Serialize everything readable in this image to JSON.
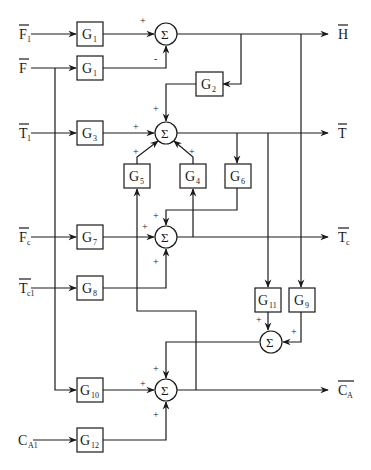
{
  "diagram": {
    "type": "block-diagram",
    "inputs": [
      {
        "id": "F1",
        "main": "F",
        "sub": "1",
        "overbar": true
      },
      {
        "id": "F",
        "main": "F",
        "sub": "",
        "overbar": true
      },
      {
        "id": "T1",
        "main": "T",
        "sub": "1",
        "overbar": true
      },
      {
        "id": "Fc",
        "main": "F",
        "sub": "c",
        "overbar": true
      },
      {
        "id": "Tc1",
        "main": "T",
        "sub": "c1",
        "overbar": true
      },
      {
        "id": "CA1",
        "main": "C",
        "sub": "A1",
        "overbar": false
      }
    ],
    "outputs": [
      {
        "id": "H",
        "main": "H",
        "sub": "",
        "overbar": true
      },
      {
        "id": "T",
        "main": "T",
        "sub": "",
        "overbar": true
      },
      {
        "id": "Tc",
        "main": "T",
        "sub": "c",
        "overbar": true
      },
      {
        "id": "CA",
        "main": "C",
        "sub": "A",
        "overbar": true
      }
    ],
    "blocks": [
      {
        "id": "G1a",
        "main": "G",
        "sub": "1"
      },
      {
        "id": "G1b",
        "main": "G",
        "sub": "1"
      },
      {
        "id": "G2",
        "main": "G",
        "sub": "2"
      },
      {
        "id": "G3",
        "main": "G",
        "sub": "3"
      },
      {
        "id": "G5",
        "main": "G",
        "sub": "5"
      },
      {
        "id": "G4",
        "main": "G",
        "sub": "4"
      },
      {
        "id": "G6",
        "main": "G",
        "sub": "6"
      },
      {
        "id": "G7",
        "main": "G",
        "sub": "7"
      },
      {
        "id": "G8",
        "main": "G",
        "sub": "8"
      },
      {
        "id": "G11",
        "main": "G",
        "sub": "11"
      },
      {
        "id": "G9",
        "main": "G",
        "sub": "9"
      },
      {
        "id": "G10",
        "main": "G",
        "sub": "10"
      },
      {
        "id": "G12",
        "main": "G",
        "sub": "12"
      }
    ],
    "summing_symbol": "Σ",
    "signs": {
      "sum1_top_input": "+",
      "sum1_bottom_input": "-",
      "sum2_top": "+",
      "sum2_left": "+",
      "sum2_g5": "+",
      "sum2_g4": "+",
      "sum3_top": "+",
      "sum3_left": "+",
      "sum3_bottom": "+",
      "sum4_g11": "+",
      "sum4_g9": "+",
      "sum5_top": "+",
      "sum5_left": "+",
      "sum5_bottom": "+"
    }
  }
}
